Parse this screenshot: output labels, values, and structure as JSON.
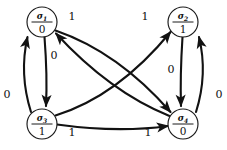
{
  "diagram": {
    "type": "state-transition-graph",
    "background_color": "#ffffff",
    "edge_color": "#121212",
    "node_stroke_color": "#1a1a1a",
    "node_fill_color": "#ffffff",
    "nodes": [
      {
        "id": "s1",
        "state": "σ",
        "subscript": "1",
        "output": "0",
        "cx": 42,
        "cy": 22,
        "r": 15
      },
      {
        "id": "s2",
        "state": "σ",
        "subscript": "2",
        "output": "1",
        "cx": 183,
        "cy": 22,
        "r": 15
      },
      {
        "id": "s3",
        "state": "σ",
        "subscript": "3",
        "output": "1",
        "cx": 42,
        "cy": 124,
        "r": 15
      },
      {
        "id": "s4",
        "state": "σ",
        "subscript": "4",
        "output": "0",
        "cx": 183,
        "cy": 124,
        "r": 15
      }
    ],
    "edges": [
      {
        "id": "e-s1-s4",
        "from": "s1",
        "to": "s4",
        "label": "1",
        "label_x": 72,
        "label_y": 17
      },
      {
        "id": "e-s3-s2",
        "from": "s3",
        "to": "s2",
        "label": "1",
        "label_x": 145,
        "label_y": 17
      },
      {
        "id": "e-s1-s3",
        "from": "s1",
        "to": "s3",
        "label": "0",
        "label_x": 54,
        "label_y": 56
      },
      {
        "id": "e-s3-s1",
        "from": "s3",
        "to": "s1",
        "label": "0",
        "label_x": 7,
        "label_y": 95
      },
      {
        "id": "e-s2-s4",
        "from": "s2",
        "to": "s4",
        "label": "0",
        "label_x": 171,
        "label_y": 70
      },
      {
        "id": "e-s4-s2",
        "from": "s4",
        "to": "s2",
        "label": "0",
        "label_x": 219,
        "label_y": 95
      },
      {
        "id": "e-s3-s4",
        "from": "s3",
        "to": "s4",
        "label": "1",
        "label_x": 72,
        "label_y": 133
      },
      {
        "id": "e-s4-s1",
        "from": "s4",
        "to": "s1",
        "label": "1",
        "label_x": 148,
        "label_y": 133
      }
    ]
  }
}
